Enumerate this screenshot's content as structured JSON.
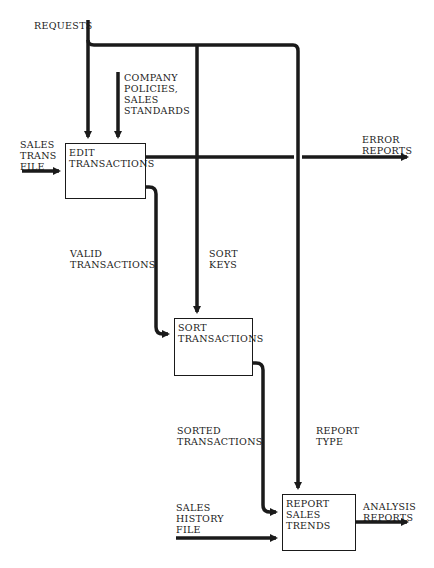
{
  "diagram": {
    "type": "IDEF0 process flow",
    "processes": [
      {
        "id": "edit",
        "label": "EDIT\nTRANSACTIONS"
      },
      {
        "id": "sort",
        "label": "SORT\nTRANSACTIONS"
      },
      {
        "id": "report",
        "label": "REPORT\nSALES\nTRENDS"
      }
    ],
    "flows": {
      "requests": "REQUESTS",
      "company_policies": "COMPANY\nPOLICIES,\nSALES\nSTANDARDS",
      "sales_trans_file": "SALES\nTRANS\nFILE",
      "error_reports": "ERROR\nREPORTS",
      "valid_transactions": "VALID\nTRANSACTIONS",
      "sort_keys": "SORT\nKEYS",
      "sorted_transactions": "SORTED\nTRANSACTIONS",
      "report_type": "REPORT\nTYPE",
      "sales_history_file": "SALES\nHISTORY\nFILE",
      "analysis_reports": "ANALYSIS\nREPORTS"
    },
    "colors": {
      "line": "#1a1a1a",
      "background": "#ffffff"
    }
  }
}
